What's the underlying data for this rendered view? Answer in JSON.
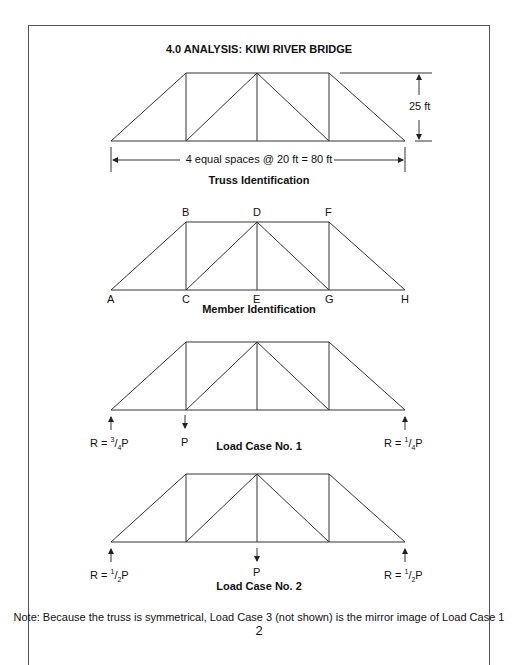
{
  "title": "4.0 ANALYSIS: KIWI RIVER BRIDGE",
  "truss_identification": {
    "caption": "Truss Identification",
    "height_label": "25 ft",
    "span_label": "4 equal spaces @ 20 ft  = 80 ft"
  },
  "member_identification": {
    "caption": "Member Identification",
    "nodes": {
      "A": "A",
      "B": "B",
      "C": "C",
      "D": "D",
      "E": "E",
      "F": "F",
      "G": "G",
      "H": "H"
    }
  },
  "load_case_1": {
    "caption": "Load Case No. 1",
    "left_reaction": {
      "prefix": "R = ",
      "num": "3",
      "den": "4",
      "suffix": "P"
    },
    "load": "P",
    "right_reaction": {
      "prefix": "R = ",
      "num": "1",
      "den": "4",
      "suffix": "P"
    }
  },
  "load_case_2": {
    "caption": "Load Case No. 2",
    "left_reaction": {
      "prefix": "R = ",
      "num": "1",
      "den": "2",
      "suffix": "P"
    },
    "load": "P",
    "right_reaction": {
      "prefix": "R = ",
      "num": "1",
      "den": "2",
      "suffix": "P"
    }
  },
  "note": "Note: Because the truss is symmetrical, Load Case 3 (not shown) is the mirror image of Load Case 1",
  "page_number": "2"
}
